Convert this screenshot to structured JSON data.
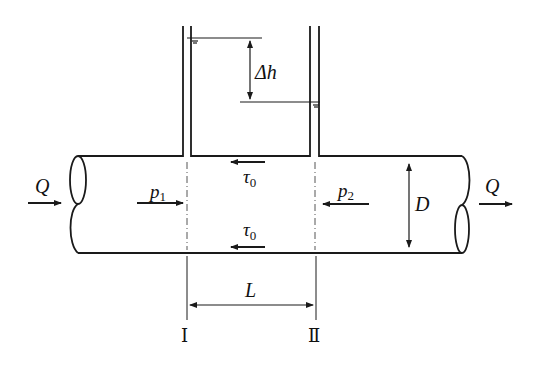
{
  "diagram": {
    "labels": {
      "flow_in": "Q",
      "flow_out": "Q",
      "pressure_1": "p",
      "pressure_1_sub": "1",
      "pressure_2": "p",
      "pressure_2_sub": "2",
      "shear_top": "τ",
      "shear_top_sub": "0",
      "shear_bottom": "τ",
      "shear_bottom_sub": "0",
      "head_difference": "Δh",
      "diameter": "D",
      "length": "L",
      "section_1": "Ⅰ",
      "section_2": "Ⅱ"
    },
    "colors": {
      "stroke": "#1a1a1a",
      "background": "#ffffff"
    }
  }
}
